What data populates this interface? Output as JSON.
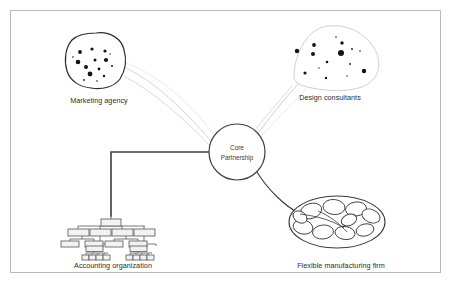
{
  "figure": {
    "background_color": "#ffffff",
    "frame": {
      "name": "figure-border",
      "x": 10,
      "y": 10,
      "width": 431,
      "height": 263,
      "stroke": "#b9b9b9"
    }
  },
  "hub": {
    "label_line1": "Core",
    "label_line2": "Partnership",
    "cx": 237,
    "cy": 152,
    "r": 28,
    "stroke": "#3f3f3f"
  },
  "nodes": [
    {
      "id": "marketing-agency",
      "label": "Marketing agency",
      "label_x": 99,
      "label_y": 100,
      "type": "dot-cluster-blob",
      "stroke": "#2f2f2f",
      "dot_color": "#141414",
      "blob_cx": 96,
      "blob_cy": 60,
      "dots": [
        {
          "x": 80,
          "y": 52,
          "r": 1.9
        },
        {
          "x": 92,
          "y": 49,
          "r": 1.6
        },
        {
          "x": 105,
          "y": 51,
          "r": 1.6
        },
        {
          "x": 78,
          "y": 62,
          "r": 2.3
        },
        {
          "x": 95,
          "y": 60,
          "r": 1.5
        },
        {
          "x": 106,
          "y": 60,
          "r": 2.1
        },
        {
          "x": 86,
          "y": 67,
          "r": 2.0
        },
        {
          "x": 99,
          "y": 69,
          "r": 1.4
        },
        {
          "x": 90,
          "y": 74,
          "r": 2.4
        },
        {
          "x": 104,
          "y": 76,
          "r": 1.2
        },
        {
          "x": 112,
          "y": 66,
          "r": 1.0
        },
        {
          "x": 73,
          "y": 57,
          "r": 0.8
        },
        {
          "x": 84,
          "y": 80,
          "r": 0.9
        },
        {
          "x": 97,
          "y": 81,
          "r": 0.8
        },
        {
          "x": 110,
          "y": 54,
          "r": 0.7
        }
      ]
    },
    {
      "id": "design-consultants",
      "label": "Design consultants",
      "label_x": 330,
      "label_y": 97,
      "type": "dot-cluster-blob",
      "stroke": "#cfcfcf",
      "dot_color": "#141414",
      "blob_cx": 338,
      "blob_cy": 57,
      "dots": [
        {
          "x": 297,
          "y": 51,
          "r": 2.2
        },
        {
          "x": 314,
          "y": 45,
          "r": 1.9
        },
        {
          "x": 313,
          "y": 54,
          "r": 2.0
        },
        {
          "x": 342,
          "y": 43,
          "r": 1.7
        },
        {
          "x": 341,
          "y": 53,
          "r": 3.0
        },
        {
          "x": 327,
          "y": 62,
          "r": 1.3
        },
        {
          "x": 352,
          "y": 49,
          "r": 0.9
        },
        {
          "x": 360,
          "y": 51,
          "r": 0.8
        },
        {
          "x": 364,
          "y": 71,
          "r": 2.2
        },
        {
          "x": 305,
          "y": 73,
          "r": 1.6
        },
        {
          "x": 326,
          "y": 78,
          "r": 1.2
        },
        {
          "x": 336,
          "y": 37,
          "r": 0.8
        },
        {
          "x": 350,
          "y": 64,
          "r": 0.9
        },
        {
          "x": 319,
          "y": 68,
          "r": 0.7
        },
        {
          "x": 347,
          "y": 76,
          "r": 0.7
        }
      ]
    },
    {
      "id": "accounting-organization",
      "label": "Accounting organization",
      "label_x": 113,
      "label_y": 265,
      "type": "org-chart",
      "stroke": "#555555",
      "fill": "#f2f2f2"
    },
    {
      "id": "flexible-manufacturing-firm",
      "label": "Flexible manufacturing firm",
      "label_x": 341,
      "label_y": 265,
      "type": "cell-ellipse",
      "stroke": "#3a3a3a",
      "ellipse_cx": 337,
      "ellipse_cy": 222,
      "ellipse_rx": 48,
      "ellipse_ry": 26
    }
  ],
  "connectors": [
    {
      "id": "marketing-to-hub",
      "from": "marketing-agency",
      "to": "hub",
      "style": "curve",
      "stroke": "#d2d2d2"
    },
    {
      "id": "design-to-hub",
      "from": "design-consultants",
      "to": "hub",
      "style": "curve",
      "stroke": "#d2d2d2"
    },
    {
      "id": "accounting-to-hub",
      "from": "accounting-organization",
      "to": "hub",
      "style": "elbow",
      "stroke": "#3c3c3c"
    },
    {
      "id": "manufacturing-to-hub",
      "from": "flexible-manufacturing-firm",
      "to": "hub",
      "style": "curve",
      "stroke": "#3c3c3c"
    }
  ]
}
